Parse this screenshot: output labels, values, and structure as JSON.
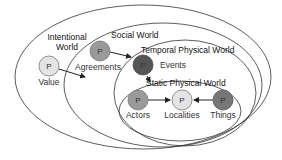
{
  "worlds": [
    {
      "id": "intentional",
      "label_line1": "Intentional",
      "label_line2": "World"
    },
    {
      "id": "social",
      "label": "Social World"
    },
    {
      "id": "temporal",
      "label": "Temporal Physical World"
    },
    {
      "id": "static",
      "label": "Static Physical World"
    }
  ],
  "nodes": [
    {
      "id": "value",
      "symbol": "P",
      "label": "Value",
      "fill": "#e4e4e4"
    },
    {
      "id": "agreements",
      "symbol": "P",
      "label": "Agreements",
      "fill": "#9a9a9a"
    },
    {
      "id": "events",
      "symbol": "P",
      "label": "Events",
      "fill": "#555555"
    },
    {
      "id": "actors",
      "symbol": "P",
      "label": "Actors",
      "fill": "#9a9a9a"
    },
    {
      "id": "localities",
      "symbol": "P",
      "label": "Localities",
      "fill": "#e4e4e4"
    },
    {
      "id": "things",
      "symbol": "P",
      "label": "Things",
      "fill": "#777777"
    }
  ],
  "edges": [
    {
      "from": "value",
      "to": "agreements"
    },
    {
      "from": "agreements",
      "to": "events"
    },
    {
      "from": "events",
      "to": "actors"
    },
    {
      "from": "actors",
      "to": "localities"
    },
    {
      "from": "things",
      "to": "localities"
    }
  ]
}
